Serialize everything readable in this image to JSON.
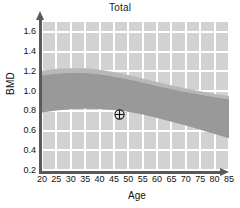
{
  "chart_data": {
    "type": "area",
    "title": "Total",
    "xlabel": "Age",
    "ylabel": "BMD",
    "xlim": [
      20,
      85
    ],
    "ylim": [
      0.2,
      1.7
    ],
    "grid": true,
    "legend": null,
    "xticks": [
      20,
      25,
      30,
      35,
      40,
      45,
      50,
      55,
      60,
      65,
      70,
      75,
      80,
      85
    ],
    "xtick_labels": [
      "20",
      "25",
      "30",
      "35",
      "40",
      "45",
      "50",
      "55",
      "60",
      "65",
      "70",
      "75",
      "80",
      "85"
    ],
    "yticks": [
      0.2,
      0.4,
      0.6,
      0.8,
      1.0,
      1.2,
      1.4,
      1.6
    ],
    "ytick_labels": [
      "0.2",
      "0.4",
      "0.6",
      "0.8",
      "1.0",
      "1.2",
      "1.4",
      "1.6"
    ],
    "x": [
      20,
      25,
      30,
      35,
      40,
      45,
      50,
      55,
      60,
      65,
      70,
      75,
      80,
      85
    ],
    "series": [
      {
        "name": "reference-band-upper",
        "values": [
          1.205,
          1.225,
          1.232,
          1.23,
          1.216,
          1.193,
          1.163,
          1.128,
          1.092,
          1.058,
          1.026,
          0.998,
          0.973,
          0.95
        ]
      },
      {
        "name": "reference-band-lower",
        "values": [
          0.782,
          0.802,
          0.815,
          0.82,
          0.818,
          0.808,
          0.79,
          0.762,
          0.727,
          0.69,
          0.65,
          0.608,
          0.565,
          0.522
        ]
      },
      {
        "name": "upper-subband-lower-edge",
        "values": [
          1.16,
          1.178,
          1.186,
          1.184,
          1.17,
          1.148,
          1.12,
          1.086,
          1.052,
          1.02,
          0.99,
          0.964,
          0.94,
          0.918
        ]
      },
      {
        "name": "inner-band-upper",
        "values": [
          1.035,
          1.05,
          1.056,
          1.052,
          1.04,
          1.022,
          0.997,
          0.966,
          0.932,
          0.898,
          0.864,
          0.832,
          0.8,
          0.77
        ]
      }
    ],
    "annotations": [
      {
        "name": "patient-measurement-marker",
        "symbol": "crosshair-circle",
        "x": 47,
        "y": 0.76,
        "label": ""
      }
    ],
    "colors": {
      "plot_background": "#d2d2d2",
      "grid": "#ffffff",
      "band_main": "#999999",
      "band_light": "#b8b8b8",
      "axis": "#5a5a5a",
      "text": "#111111",
      "marker": "#1a1a1a"
    }
  }
}
